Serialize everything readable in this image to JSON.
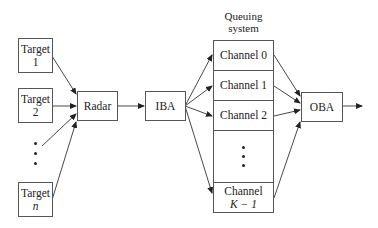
{
  "diagram": {
    "targets": [
      {
        "line1": "Target",
        "line2": "1"
      },
      {
        "line1": "Target",
        "line2": "2"
      },
      {
        "line1": "Target",
        "line2": "n"
      }
    ],
    "radar": "Radar",
    "iba": "IBA",
    "queue": {
      "title_line1": "Queuing",
      "title_line2": "system",
      "channels": [
        "Channel 0",
        "Channel 1",
        "Channel 2"
      ],
      "last_channel_line1": "Channel",
      "last_channel_line2": "K − 1"
    },
    "oba": "OBA"
  }
}
